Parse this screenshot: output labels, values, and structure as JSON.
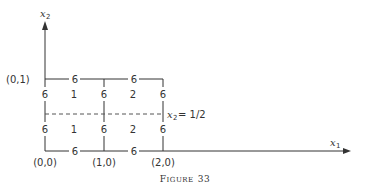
{
  "axes": {
    "x_label_var": "x",
    "x_label_sub": "1",
    "y_label_var": "x",
    "y_label_sub": "2"
  },
  "points": {
    "p00": "(0,0)",
    "p10": "(1,0)",
    "p20": "(2,0)",
    "p01": "(0,1)"
  },
  "edges": {
    "top_left": "6",
    "top_right": "6",
    "bottom_left": "6",
    "bottom_right": "6",
    "left_upper": "6",
    "left_lower": "6",
    "mid_upper": "6",
    "mid_lower": "6",
    "right_upper": "6",
    "right_lower": "6"
  },
  "cells": {
    "upper_left": "1",
    "upper_right": "2",
    "lower_left": "1",
    "lower_right": "2"
  },
  "cut_line": {
    "var": "x",
    "sub": "2",
    "rhs": "= 1/2"
  },
  "caption": {
    "first": "F",
    "rest": "IGURE",
    "number": "33"
  }
}
